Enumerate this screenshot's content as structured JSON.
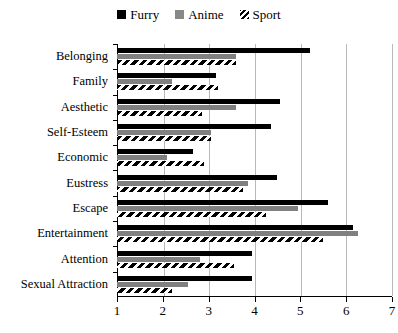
{
  "chart_data": {
    "type": "bar",
    "orientation": "horizontal",
    "title": "",
    "xlabel": "",
    "ylabel": "",
    "xlim": [
      1,
      7
    ],
    "xticks": [
      1,
      2,
      3,
      4,
      5,
      6,
      7
    ],
    "grid": true,
    "legend_position": "top-center",
    "categories": [
      "Belonging",
      "Family",
      "Aesthetic",
      "Self-Esteem",
      "Economic",
      "Eustress",
      "Escape",
      "Entertainment",
      "Attention",
      "Sexual Attraction"
    ],
    "series": [
      {
        "name": "Furry",
        "color": "#000000",
        "pattern": "solid",
        "values": [
          5.2,
          3.15,
          4.55,
          4.35,
          2.65,
          4.5,
          5.6,
          6.15,
          3.95,
          3.95
        ]
      },
      {
        "name": "Anime",
        "color": "#808080",
        "pattern": "solid",
        "values": [
          3.6,
          2.2,
          3.6,
          3.05,
          2.1,
          3.85,
          4.95,
          6.25,
          2.8,
          2.55
        ]
      },
      {
        "name": "Sport",
        "color": "#ffffff",
        "pattern": "diagonal-hatch",
        "values": [
          3.6,
          3.2,
          2.85,
          3.05,
          2.9,
          3.75,
          4.25,
          5.5,
          3.55,
          2.2
        ]
      }
    ]
  },
  "legend": {
    "items": [
      {
        "label": "Furry",
        "swatch": "furry"
      },
      {
        "label": "Anime",
        "swatch": "anime"
      },
      {
        "label": "Sport",
        "swatch": "sport"
      }
    ]
  }
}
